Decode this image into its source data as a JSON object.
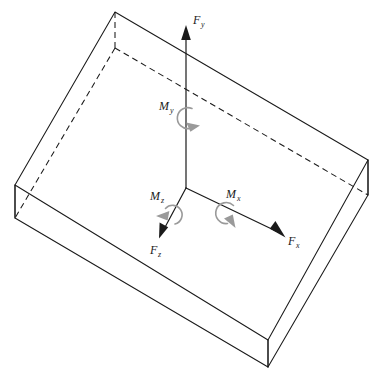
{
  "figure": {
    "kind": "3d-force-moment-diagram",
    "background_color": "#ffffff",
    "line_color": "#1a1a1a",
    "moment_color": "#9a9a9a"
  },
  "body": {
    "name": "rectangular-plate",
    "top_face": {
      "corners": [
        {
          "id": "top-rear",
          "x": 115,
          "y": 12
        },
        {
          "id": "top-right",
          "x": 368,
          "y": 160
        },
        {
          "id": "top-front",
          "x": 268,
          "y": 340
        },
        {
          "id": "top-left",
          "x": 15,
          "y": 185
        }
      ]
    },
    "bottom_face": {
      "corners": [
        {
          "id": "bottom-right",
          "x": 368,
          "y": 195
        },
        {
          "id": "bottom-front",
          "x": 268,
          "y": 367
        },
        {
          "id": "bottom-left",
          "x": 15,
          "y": 218
        }
      ]
    },
    "hidden_corner": {
      "id": "inner-rear",
      "x": 115,
      "y": 48
    },
    "hidden_edges": [
      {
        "from": "top-rear",
        "to": "inner-rear"
      },
      {
        "from": "inner-rear",
        "to": "top-left-inner"
      },
      {
        "from": "inner-rear",
        "to": "top-right-inner"
      }
    ]
  },
  "origin": {
    "x": 186,
    "y": 188
  },
  "forces": [
    {
      "id": "Fy",
      "label": "F",
      "subscript": "y",
      "label_x": 196,
      "label_y": 22,
      "tip": {
        "x": 186,
        "y": 25
      },
      "direction": "up"
    },
    {
      "id": "Fz",
      "label": "F",
      "subscript": "z",
      "label_x": 152,
      "label_y": 253,
      "tip": {
        "x": 159,
        "y": 238
      },
      "direction": "down-left"
    },
    {
      "id": "Fx",
      "label": "F",
      "subscript": "x",
      "label_x": 289,
      "label_y": 245,
      "tip": {
        "x": 285,
        "y": 237
      },
      "direction": "down-right"
    }
  ],
  "moments": [
    {
      "id": "My",
      "label": "M",
      "subscript": "y",
      "label_x": 160,
      "label_y": 108,
      "center": {
        "x": 186,
        "y": 118
      },
      "radius": 10,
      "about_axis": "Fy"
    },
    {
      "id": "Mz",
      "label": "M",
      "subscript": "z",
      "label_x": 152,
      "label_y": 198,
      "center": {
        "x": 172,
        "y": 215
      },
      "radius": 9,
      "about_axis": "Fz"
    },
    {
      "id": "Mx",
      "label": "M",
      "subscript": "x",
      "label_x": 228,
      "label_y": 196,
      "center": {
        "x": 230,
        "y": 213
      },
      "radius": 10,
      "about_axis": "Fx"
    }
  ]
}
